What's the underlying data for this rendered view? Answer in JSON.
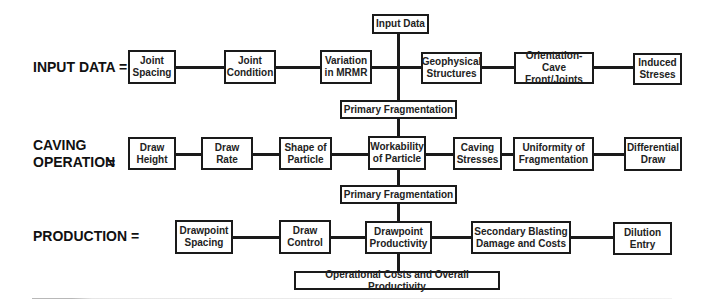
{
  "diagram": {
    "title_node": "Input Data",
    "rows": [
      {
        "label": "INPUT DATA =",
        "nodes": [
          "Joint\nSpacing",
          "Joint\nCondition",
          "Variation\nin MRMR",
          "Geophysical\nStructures",
          "Orientation-Cave\nFront/Joints",
          "Induced\nStreses"
        ]
      },
      {
        "label": "CAVING\nOPERATION",
        "equals": "=",
        "nodes": [
          "Draw\nHeight",
          "Draw\nRate",
          "Shape of\nParticle",
          "Workability\nof Particle",
          "Caving\nStresses",
          "Uniformity of\nFragmentation",
          "Differential\nDraw"
        ]
      },
      {
        "label": "PRODUCTION =",
        "nodes": [
          "Drawpoint\nSpacing",
          "Draw\nControl",
          "Drawpoint\nProductivity",
          "Secondary Blasting\nDamage and Costs",
          "Dilution\nEntry"
        ]
      }
    ],
    "connectors": [
      "Primary Fragmentation",
      "Primary Fragmentation"
    ],
    "output_node": "Operational Costs and Overall Productivity"
  },
  "colors": {
    "line": "#1a1a1a",
    "box_border": "#1a1a1a",
    "background": "#ffffff",
    "text": "#222222"
  }
}
